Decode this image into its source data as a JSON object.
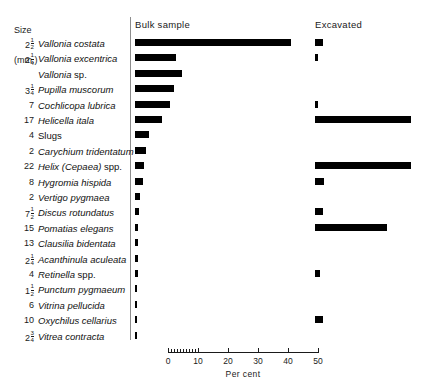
{
  "header": {
    "size_label_line1": "Size",
    "size_label_line2": "(mm.)",
    "bulk_column": "Bulk sample",
    "excavated_column": "Excavated"
  },
  "axis": {
    "title": "Per cent",
    "ticks": [
      {
        "value": 0,
        "label": "0"
      },
      {
        "value": 10,
        "label": "10"
      },
      {
        "value": 20,
        "label": "20"
      },
      {
        "value": 30,
        "label": "30"
      },
      {
        "value": 40,
        "label": "40"
      },
      {
        "value": 50,
        "label": "50"
      }
    ],
    "minor_ticks": [
      1,
      2,
      3,
      4,
      5,
      6,
      7,
      8,
      9
    ],
    "range": [
      0,
      50
    ]
  },
  "colors": {
    "bar": "#000000",
    "text": "#111111",
    "rule": "#8d8d8d"
  },
  "chart_data": {
    "type": "bar",
    "title": "",
    "xlabel": "Per cent",
    "ylabel": "",
    "xlim": [
      0,
      50
    ],
    "grid": false,
    "orientation": "horizontal",
    "legend_position": "top",
    "series": [
      {
        "name": "Bulk sample",
        "key": "bulk"
      },
      {
        "name": "Excavated",
        "key": "excavated"
      }
    ],
    "categories": [
      "Vallonia costata",
      "Vallonia excentrica",
      "Vallonia sp.",
      "Pupilla muscorum",
      "Cochlicopa lubrica",
      "Helicella itala",
      "Slugs",
      "Carychium tridentatum",
      "Helix (Cepaea) spp.",
      "Hygromia hispida",
      "Vertigo pygmaea",
      "Discus rotundatus",
      "Pomatias elegans",
      "Clausilia bidentata",
      "Acanthinula aculeata",
      "Retinella spp.",
      "Punctum pygmaeum",
      "Vitrina pellucida",
      "Oxychilus cellarius",
      "Vitrea contracta"
    ],
    "rows": [
      {
        "size_whole": "2",
        "size_num": "1",
        "size_den": "2",
        "name": "Vallonia costata",
        "name_suffix": "",
        "bulk": 52.0,
        "excavated": 2.5
      },
      {
        "size_whole": "2",
        "size_num": "1",
        "size_den": "4",
        "name": "Vallonia excentrica",
        "name_suffix": "",
        "bulk": 13.5,
        "excavated": 1.0
      },
      {
        "size_whole": "",
        "size_num": "",
        "size_den": "",
        "name": "Vallonia",
        "name_suffix": "sp.",
        "bulk": 15.5,
        "excavated": 0
      },
      {
        "size_whole": "3",
        "size_num": "1",
        "size_den": "4",
        "name": "Pupilla muscorum",
        "name_suffix": "",
        "bulk": 13.0,
        "excavated": 0
      },
      {
        "size_whole": "7",
        "size_num": "",
        "size_den": "",
        "name": "Cochlicopa lubrica",
        "name_suffix": "",
        "bulk": 11.5,
        "excavated": 1.0
      },
      {
        "size_whole": "17",
        "size_num": "",
        "size_den": "",
        "name": "Helicella itala",
        "name_suffix": "",
        "bulk": 9.0,
        "excavated": 32.0
      },
      {
        "size_whole": "4",
        "size_num": "",
        "size_den": "",
        "name": "Slugs",
        "name_suffix": "",
        "bulk": 4.5,
        "excavated": 0,
        "roman": true
      },
      {
        "size_whole": "2",
        "size_num": "",
        "size_den": "",
        "name": "Carychium tridentatum",
        "name_suffix": "",
        "bulk": 3.5,
        "excavated": 0
      },
      {
        "size_whole": "22",
        "size_num": "",
        "size_den": "",
        "name": "Helix (Cepaea)",
        "name_suffix": "spp.",
        "bulk": 3.0,
        "excavated": 32.0
      },
      {
        "size_whole": "8",
        "size_num": "",
        "size_den": "",
        "name": "Hygromia hispida",
        "name_suffix": "",
        "bulk": 2.5,
        "excavated": 3.0
      },
      {
        "size_whole": "2",
        "size_num": "",
        "size_den": "",
        "name": "Vertigo pygmaea",
        "name_suffix": "",
        "bulk": 1.5,
        "excavated": 0
      },
      {
        "size_whole": "7",
        "size_num": "1",
        "size_den": "2",
        "name": "Discus rotundatus",
        "name_suffix": "",
        "bulk": 1.2,
        "excavated": 2.5
      },
      {
        "size_whole": "15",
        "size_num": "",
        "size_den": "",
        "name": "Pomatias elegans",
        "name_suffix": "",
        "bulk": 1.0,
        "excavated": 24.0
      },
      {
        "size_whole": "13",
        "size_num": "",
        "size_den": "",
        "name": "Clausilia bidentata",
        "name_suffix": "",
        "bulk": 1.0,
        "excavated": 0
      },
      {
        "size_whole": "2",
        "size_num": "1",
        "size_den": "4",
        "name": "Acanthinula aculeata",
        "name_suffix": "",
        "bulk": 1.0,
        "excavated": 0
      },
      {
        "size_whole": "4",
        "size_num": "",
        "size_den": "",
        "name": "Retinella",
        "name_suffix": "spp.",
        "bulk": 1.0,
        "excavated": 1.5
      },
      {
        "size_whole": "1",
        "size_num": "1",
        "size_den": "2",
        "name": "Punctum pygmaeum",
        "name_suffix": "",
        "bulk": 0.8,
        "excavated": 0
      },
      {
        "size_whole": "6",
        "size_num": "",
        "size_den": "",
        "name": "Vitrina pellucida",
        "name_suffix": "",
        "bulk": 0.8,
        "excavated": 0
      },
      {
        "size_whole": "10",
        "size_num": "",
        "size_den": "",
        "name": "Oxychilus cellarius",
        "name_suffix": "",
        "bulk": 0.8,
        "excavated": 2.5
      },
      {
        "size_whole": "2",
        "size_num": "3",
        "size_den": "4",
        "name": "Vitrea contracta",
        "name_suffix": "",
        "bulk": 0.8,
        "excavated": 0
      }
    ]
  }
}
